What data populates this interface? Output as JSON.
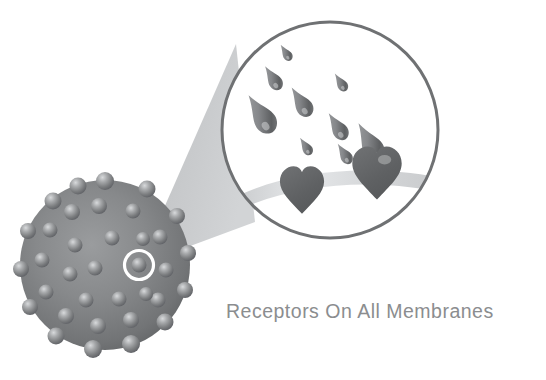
{
  "figure": {
    "title": "Receptors On All Membranes",
    "caption_text": "Receptors On All Membranes",
    "background_color": "#ffffff",
    "caption_color": "#8b8d8f"
  },
  "cell": {
    "label": "cell-body",
    "description": "Grey spherical cell covered with receptor bumps",
    "center_x": 105,
    "center_y": 265,
    "radius": 85,
    "fill_dark": "#6e7072",
    "fill_light": "#97999b",
    "receptor_count": 37,
    "highlight_ring_color": "#ffffff",
    "highlight_ring_x": 139,
    "highlight_ring_y": 265,
    "highlight_ring_radius": 15
  },
  "beam": {
    "label": "magnifier-beam",
    "fill_color": "#c2c4c6",
    "apex_x": 139,
    "apex_y": 265
  },
  "magnifier": {
    "label": "magnified-view",
    "center_x": 330,
    "center_y": 130,
    "radius": 110,
    "stroke_color": "#6f7173",
    "stroke_width": 3,
    "fill_color": "#ffffff"
  },
  "membrane_band": {
    "label": "membrane-band",
    "fill_color": "#cfd1d3",
    "highlight_color": "#e8eaec"
  },
  "ligands": {
    "label": "signal-molecule-drops",
    "fill_dark": "#5f6163",
    "fill_light": "#9a9c9e",
    "count": 9,
    "items": [
      {
        "x": 288,
        "y": 56,
        "size": 13,
        "rot": -35
      },
      {
        "x": 277,
        "y": 82,
        "size": 19,
        "rot": -35
      },
      {
        "x": 268,
        "y": 121,
        "size": 31,
        "rot": -35
      },
      {
        "x": 305,
        "y": 108,
        "size": 24,
        "rot": -35
      },
      {
        "x": 342,
        "y": 85,
        "size": 14,
        "rot": -35
      },
      {
        "x": 309,
        "y": 147,
        "size": 14,
        "rot": -35
      },
      {
        "x": 341,
        "y": 131,
        "size": 22,
        "rot": -35
      },
      {
        "x": 346,
        "y": 157,
        "size": 17,
        "rot": -35
      },
      {
        "x": 372,
        "y": 150,
        "size": 30,
        "rot": -35
      }
    ]
  },
  "receptors_zoomed": {
    "label": "heart-shaped-receptors",
    "fill_color": "#636567",
    "count": 2,
    "items": [
      {
        "x": 302,
        "y": 190,
        "size": 46,
        "name": "receptor-left"
      },
      {
        "x": 376,
        "y": 172,
        "size": 52,
        "name": "receptor-right"
      }
    ]
  }
}
